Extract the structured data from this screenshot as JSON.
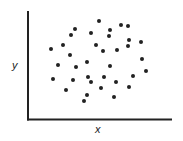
{
  "chart_data": {
    "type": "scatter",
    "title": "",
    "xlabel": "x",
    "ylabel": "y",
    "grid": false,
    "legend": null,
    "ticks": "none",
    "axis_color": "#222222",
    "marker_color": "#222222",
    "marker_radius": 2,
    "axes_pixels": {
      "origin_x": 28,
      "origin_y": 119.5,
      "x_end": 172,
      "y_top": 11
    },
    "points": [
      [
        99,
        21
      ],
      [
        121,
        25
      ],
      [
        128,
        26
      ],
      [
        75,
        29
      ],
      [
        110,
        30
      ],
      [
        71,
        35
      ],
      [
        91,
        33
      ],
      [
        109,
        36
      ],
      [
        129,
        40
      ],
      [
        141,
        42
      ],
      [
        63,
        45
      ],
      [
        96,
        45
      ],
      [
        128,
        46
      ],
      [
        51,
        49
      ],
      [
        103,
        51
      ],
      [
        117,
        50
      ],
      [
        70,
        55
      ],
      [
        142,
        59
      ],
      [
        87,
        62
      ],
      [
        58,
        65
      ],
      [
        110,
        66
      ],
      [
        76,
        67
      ],
      [
        146,
        71
      ],
      [
        53,
        79
      ],
      [
        73,
        80
      ],
      [
        88,
        77
      ],
      [
        104,
        77
      ],
      [
        133,
        76
      ],
      [
        91,
        82
      ],
      [
        116,
        82
      ],
      [
        66,
        90
      ],
      [
        101,
        88
      ],
      [
        129,
        87
      ],
      [
        87,
        95
      ],
      [
        114,
        97
      ],
      [
        84,
        101
      ]
    ]
  }
}
